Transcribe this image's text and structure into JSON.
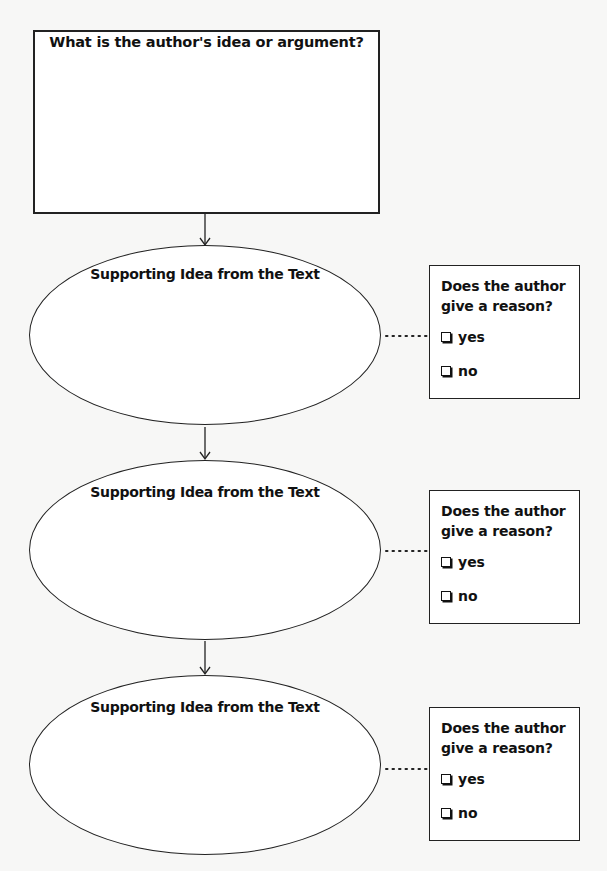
{
  "diagram": {
    "main_box": {
      "title": "What is the author's idea or argument?"
    },
    "supporting_ideas": [
      {
        "label": "Supporting Idea from the Text",
        "reason_box": {
          "question": "Does the author give a reason?",
          "options": [
            "yes",
            "no"
          ]
        }
      },
      {
        "label": "Supporting Idea from the Text",
        "reason_box": {
          "question": "Does the author give a reason?",
          "options": [
            "yes",
            "no"
          ]
        }
      },
      {
        "label": "Supporting Idea from the Text",
        "reason_box": {
          "question": "Does the author give a reason?",
          "options": [
            "yes",
            "no"
          ]
        }
      }
    ],
    "icons": {
      "arrow": "arrow-down-icon",
      "checkbox": "checkbox-icon",
      "connector": "dotted-connector"
    },
    "colors": {
      "line": "#222222",
      "background": "#f7f7f6",
      "fill": "#ffffff"
    }
  }
}
